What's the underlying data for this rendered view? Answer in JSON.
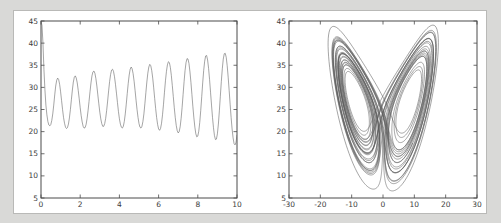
{
  "figure": {
    "background": "#ffffff",
    "page_background": "#d9d9d7",
    "line_color": "#5a5a5a",
    "frame_color": "#4a4a4a"
  },
  "chart_data": [
    {
      "type": "line",
      "name": "z-time-series",
      "title": "",
      "xlabel": "",
      "ylabel": "",
      "xlim": [
        0,
        10
      ],
      "ylim": [
        5,
        45
      ],
      "grid": false,
      "legend": null,
      "xticks": [
        0,
        2,
        4,
        6,
        8,
        10
      ],
      "xtick_labels": [
        "0",
        "2",
        "4",
        "6",
        "8",
        "10"
      ],
      "yticks": [
        5,
        10,
        15,
        20,
        25,
        30,
        35,
        40,
        45
      ],
      "ytick_labels": [
        "5",
        "10",
        "15",
        "20",
        "25",
        "30",
        "35",
        "40",
        "45"
      ],
      "series": [
        {
          "name": "z(t)",
          "x": [
            0.0,
            0.05,
            0.1,
            0.15,
            0.2,
            0.25,
            0.3,
            0.35,
            0.4,
            0.45,
            0.5,
            0.55,
            0.6,
            0.65,
            0.7,
            0.75,
            0.8,
            0.85,
            0.9,
            0.95,
            1.0,
            1.05,
            1.1,
            1.15,
            1.2,
            1.25,
            1.3,
            1.35,
            1.4,
            1.45,
            1.5,
            1.55,
            1.6,
            1.65,
            1.7,
            1.75,
            1.8,
            1.85,
            1.9,
            1.95,
            2.0,
            2.05,
            2.1,
            2.15,
            2.2,
            2.25,
            2.3,
            2.35,
            2.4,
            2.45,
            2.5,
            2.55,
            2.6,
            2.65,
            2.7,
            2.75,
            2.8,
            2.85,
            2.9,
            2.95,
            3.0,
            3.05,
            3.1,
            3.15,
            3.2,
            3.25,
            3.3,
            3.35,
            3.4,
            3.45,
            3.5,
            3.55,
            3.6,
            3.65,
            3.7,
            3.75,
            3.8,
            3.85,
            3.9,
            3.95,
            4.0,
            4.05,
            4.1,
            4.15,
            4.2,
            4.25,
            4.3,
            4.35,
            4.4,
            4.45,
            4.5,
            4.55,
            4.6,
            4.65,
            4.7,
            4.75,
            4.8,
            4.85,
            4.9,
            4.95,
            5.0,
            5.05,
            5.1,
            5.15,
            5.2,
            5.25,
            5.3,
            5.35,
            5.4,
            5.45,
            5.5,
            5.55,
            5.6,
            5.65,
            5.7,
            5.75,
            5.8,
            5.85,
            5.9,
            5.95,
            6.0,
            6.05,
            6.1,
            6.15,
            6.2,
            6.25,
            6.3,
            6.35,
            6.4,
            6.45,
            6.5,
            6.55,
            6.6,
            6.65,
            6.7,
            6.75,
            6.8,
            6.85,
            6.9,
            6.95,
            7.0,
            7.05,
            7.1,
            7.15,
            7.2,
            7.25,
            7.3,
            7.35,
            7.4,
            7.45,
            7.5,
            7.55,
            7.6,
            7.65,
            7.7,
            7.75,
            7.8,
            7.85,
            7.9,
            7.95,
            8.0,
            8.05,
            8.1,
            8.15,
            8.2,
            8.25,
            8.3,
            8.35,
            8.4,
            8.45,
            8.5,
            8.55,
            8.6,
            8.65,
            8.7,
            8.75,
            8.8,
            8.85,
            8.9,
            8.95,
            9.0,
            9.05,
            9.1,
            9.15,
            9.2,
            9.25,
            9.3,
            9.35,
            9.4,
            9.45,
            9.5,
            9.55,
            9.6,
            9.65,
            9.7,
            9.75,
            9.8,
            9.85,
            9.9,
            9.95,
            10.0
          ],
          "y": [
            45.0,
            44.0,
            40.0,
            34.0,
            29.5,
            26.0,
            23.8,
            22.3,
            21.5,
            21.3,
            21.6,
            22.5,
            24.0,
            26.0,
            28.3,
            30.3,
            31.6,
            32.1,
            31.8,
            30.7,
            29.0,
            27.0,
            25.0,
            23.2,
            21.9,
            21.0,
            20.7,
            20.9,
            21.7,
            23.1,
            25.0,
            27.2,
            29.4,
            31.2,
            32.3,
            32.6,
            32.1,
            31.0,
            29.3,
            27.4,
            25.4,
            23.6,
            22.2,
            21.2,
            20.8,
            20.9,
            21.6,
            22.9,
            24.7,
            26.8,
            29.0,
            31.0,
            32.6,
            33.5,
            33.7,
            33.2,
            32.0,
            30.3,
            28.3,
            26.3,
            24.4,
            22.9,
            21.8,
            21.2,
            21.2,
            21.8,
            23.0,
            24.8,
            26.9,
            29.2,
            31.3,
            32.9,
            33.9,
            34.1,
            33.6,
            32.4,
            30.7,
            28.7,
            26.6,
            24.6,
            22.9,
            21.7,
            21.0,
            20.8,
            21.2,
            22.3,
            24.0,
            26.2,
            28.6,
            30.9,
            32.8,
            34.1,
            34.6,
            34.2,
            33.1,
            31.4,
            29.3,
            27.1,
            25.0,
            23.2,
            21.8,
            21.0,
            20.8,
            21.2,
            22.3,
            24.0,
            26.3,
            28.8,
            31.2,
            33.2,
            34.6,
            35.2,
            34.9,
            33.8,
            32.1,
            29.9,
            27.5,
            25.2,
            23.2,
            21.6,
            20.6,
            20.3,
            20.7,
            21.9,
            23.8,
            26.2,
            28.9,
            31.5,
            33.6,
            35.1,
            35.8,
            35.6,
            34.5,
            32.7,
            30.4,
            27.9,
            25.4,
            23.2,
            21.4,
            20.2,
            19.7,
            20.0,
            21.1,
            23.0,
            25.5,
            28.4,
            31.3,
            33.8,
            35.6,
            36.5,
            36.4,
            35.4,
            33.5,
            31.1,
            28.4,
            25.6,
            23.1,
            21.0,
            19.5,
            18.8,
            19.0,
            20.1,
            22.1,
            24.8,
            27.9,
            31.0,
            33.8,
            35.9,
            37.1,
            37.2,
            36.2,
            34.3,
            31.8,
            28.9,
            26.0,
            23.2,
            20.9,
            19.1,
            18.2,
            18.3,
            19.5,
            21.7,
            24.7,
            28.0,
            31.3,
            34.2,
            36.4,
            37.6,
            37.7,
            36.8,
            34.9,
            32.3,
            29.3,
            26.2,
            23.2,
            20.6,
            18.6,
            17.3,
            17.0,
            17.6,
            19.2
          ]
        }
      ]
    },
    {
      "type": "line",
      "name": "phase-portrait-z-vs-x",
      "title": "",
      "xlabel": "",
      "ylabel": "",
      "xlim": [
        -30,
        30
      ],
      "ylim": [
        5,
        45
      ],
      "grid": false,
      "legend": null,
      "xticks": [
        -30,
        -20,
        -10,
        0,
        10,
        20,
        30
      ],
      "xtick_labels": [
        "-30",
        "-20",
        "-10",
        "0",
        "10",
        "20",
        "30"
      ],
      "yticks": [
        5,
        10,
        15,
        20,
        25,
        30,
        35,
        40,
        45
      ],
      "ytick_labels": [
        "5",
        "10",
        "15",
        "20",
        "25",
        "30",
        "35",
        "40",
        "45"
      ],
      "description": "Lorenz attractor butterfly: two lobes of spiral orbits, left lobe centered near x=-9 z=27, right lobe centered near x=9 z=27"
    }
  ]
}
